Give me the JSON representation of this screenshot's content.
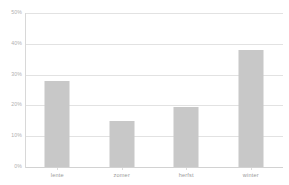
{
  "chart_data": {
    "type": "bar",
    "title": "",
    "subtitle": "",
    "xlabel": "",
    "ylabel": "",
    "categories": [
      "lente",
      "zomer",
      "herfst",
      "winter"
    ],
    "values": [
      28,
      15,
      19.5,
      38
    ],
    "value_suffix": "%",
    "ylim": [
      0,
      50
    ],
    "ytick_values": [
      0,
      10,
      20,
      30,
      40,
      50
    ],
    "ytick_labels": [
      "0%",
      "10%",
      "20%",
      "30%",
      "40%",
      "50%"
    ],
    "grid": true,
    "legend": false,
    "series": [
      {
        "name": "",
        "values": [
          28,
          15,
          19.5,
          38
        ],
        "color": "#c8c8c8"
      }
    ],
    "colors": {
      "bar": "#c8c8c8",
      "gridline": "#e2e2e2",
      "axis": "#d8d8d8",
      "tick_label": "#b0b0b0",
      "category_label": "#9a9a9a",
      "background": "#ffffff"
    }
  }
}
